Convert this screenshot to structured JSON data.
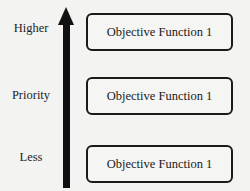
{
  "diagram": {
    "axis": {
      "labels": {
        "top": "Higher",
        "middle": "Priority",
        "bottom": "Less"
      },
      "direction": "up"
    },
    "boxes": [
      {
        "label": "Objective Function 1"
      },
      {
        "label": "Objective Function 1"
      },
      {
        "label": "Objective Function 1"
      }
    ]
  }
}
